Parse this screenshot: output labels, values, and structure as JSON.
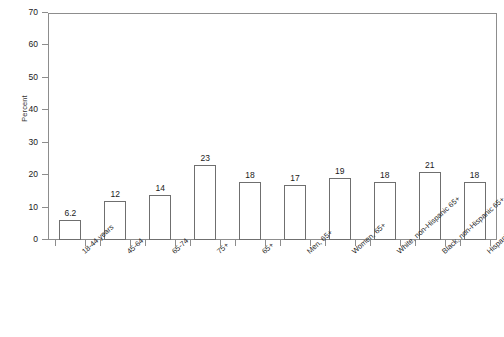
{
  "chart_data": {
    "type": "bar",
    "title": "",
    "xlabel": "",
    "ylabel": "Percent",
    "ylim": [
      0,
      70
    ],
    "ytick_step": 10,
    "yticks": [
      0,
      10,
      20,
      30,
      40,
      50,
      60,
      70
    ],
    "grid": false,
    "legend": null,
    "categories": [
      "18-44 years",
      "45-64",
      "65-74",
      "75+",
      "65+",
      "Men, 65+",
      "Women, 65+",
      "White, non-Hispanic 65+",
      "Black, non-Hispanic 65+",
      "Hispanic 65+"
    ],
    "values": [
      6.2,
      12,
      14,
      23,
      18,
      17,
      19,
      18,
      21,
      18
    ],
    "value_labels": [
      "6.2",
      "12",
      "14",
      "23",
      "18",
      "17",
      "19",
      "18",
      "21",
      "18"
    ],
    "bar_fill": "#ffffff",
    "bar_edge": "#6f6f6f",
    "axis_color": "#8d8d8d",
    "background": "#ffffff"
  }
}
